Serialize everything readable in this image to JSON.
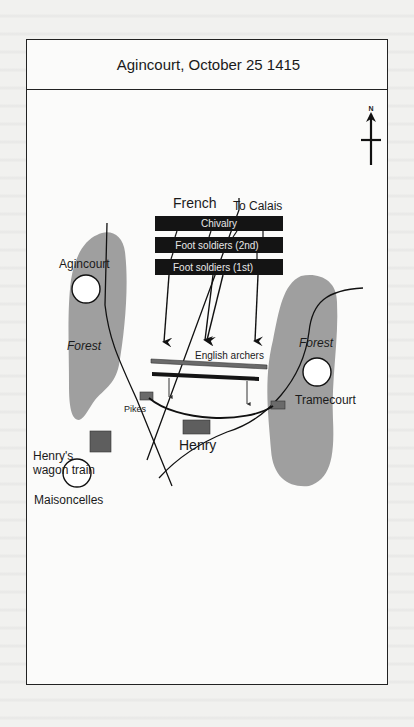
{
  "map": {
    "title": "Agincourt, October 25 1415",
    "compass": {
      "label": "N"
    },
    "sides": {
      "french": "French",
      "english_archers": "English archers",
      "henry": "Henry",
      "pikes": "Pikes",
      "wagon_train_line1": "Henry's",
      "wagon_train_line2": "wagon train"
    },
    "french_lines": [
      {
        "label": "Chivalry"
      },
      {
        "label": "Foot soldiers (2nd)"
      },
      {
        "label": "Foot soldiers (1st)"
      }
    ],
    "roads": {
      "to_calais": "To Calais"
    },
    "places": {
      "agincourt": "Agincourt",
      "tramecourt": "Tramecourt",
      "maisoncelles": "Maisoncelles"
    },
    "forests": {
      "west": "Forest",
      "east": "Forest"
    },
    "colors": {
      "forest": "#9d9d9d",
      "french_block": "#141414",
      "english_unit": "#6a6a6a",
      "frame": "#222222",
      "paper": "#fbfbfa"
    }
  }
}
